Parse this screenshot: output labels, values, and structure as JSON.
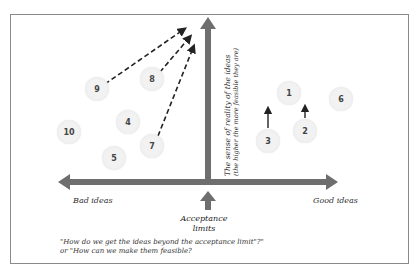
{
  "diagram": {
    "x_axis": {
      "left_label": "Bad ideas",
      "right_label": "Good ideas"
    },
    "y_axis": {
      "label_line1": "The sense of reality of the ideas",
      "label_line2": "(the higher the more feasible they are)"
    },
    "acceptance_marker": {
      "line1": "Acceptance",
      "line2": "limits"
    },
    "caption": {
      "line1": "\"How do we get the ideas beyond the acceptance limit\"?\"",
      "line2": "or \"How can we make them feasible?"
    },
    "ideas": [
      {
        "id": "1",
        "label": "1",
        "x": 289,
        "y": 93
      },
      {
        "id": "2",
        "label": "2",
        "x": 305,
        "y": 131
      },
      {
        "id": "3",
        "label": "3",
        "x": 268,
        "y": 141
      },
      {
        "id": "4",
        "label": "4",
        "x": 128,
        "y": 122
      },
      {
        "id": "5",
        "label": "5",
        "x": 114,
        "y": 158
      },
      {
        "id": "6",
        "label": "6",
        "x": 341,
        "y": 99
      },
      {
        "id": "7",
        "label": "7",
        "x": 152,
        "y": 146
      },
      {
        "id": "8",
        "label": "8",
        "x": 152,
        "y": 79
      },
      {
        "id": "9",
        "label": "9",
        "x": 97,
        "y": 89
      },
      {
        "id": "10",
        "label": "10",
        "x": 69,
        "y": 132
      }
    ],
    "colors": {
      "axis": "#6e6e6e",
      "frame": "#8a8a8a",
      "circle_fill": "#efefef",
      "dash": "#222222"
    }
  }
}
